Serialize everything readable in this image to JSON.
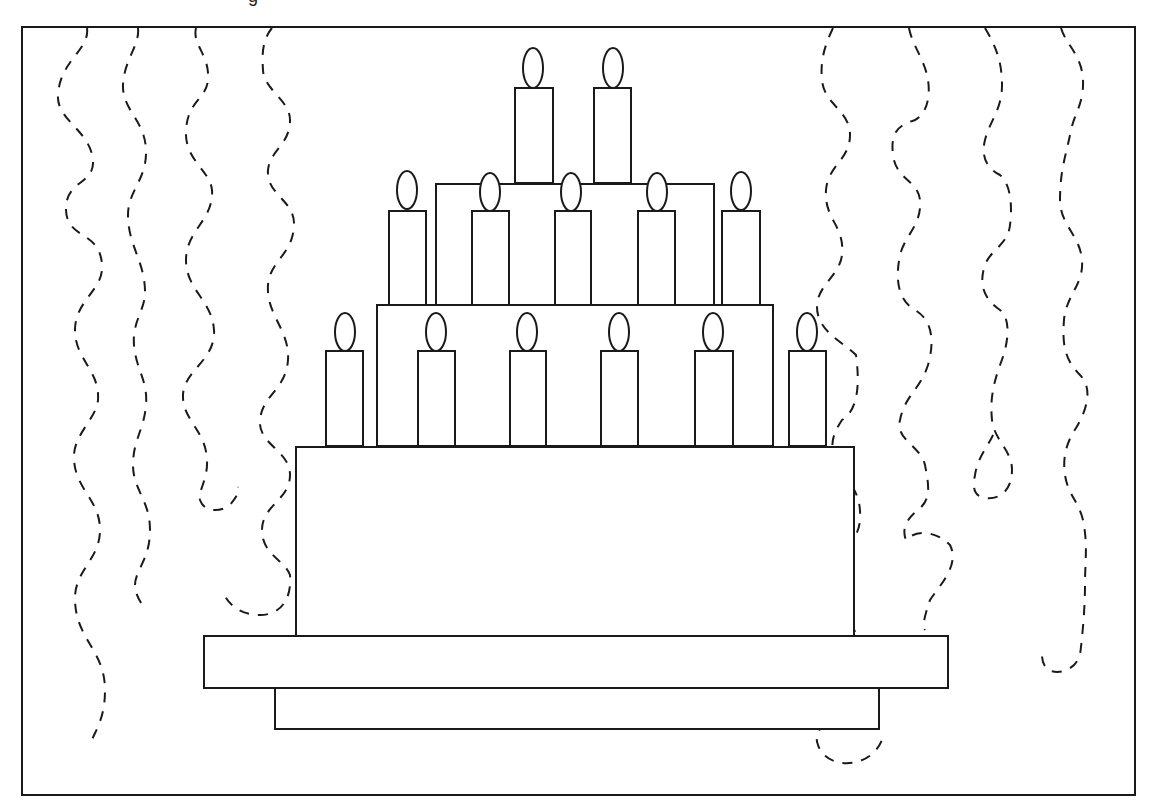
{
  "image": {
    "title_fragment": "g",
    "subject": "birthday cake with candles and streamers"
  },
  "colors": {
    "line": "#1a1a1a",
    "background": "#ffffff"
  },
  "frame": {
    "x": 22,
    "y": 27,
    "w": 1113,
    "h": 768
  },
  "cake": {
    "tiers": [
      {
        "name": "top-tier",
        "x": 436,
        "y": 184,
        "w": 278,
        "h": 121
      },
      {
        "name": "middle-tier",
        "x": 377,
        "y": 305,
        "w": 396,
        "h": 141
      },
      {
        "name": "bottom-tier",
        "x": 296,
        "y": 447,
        "w": 558,
        "h": 189
      }
    ],
    "plate": {
      "x": 204,
      "y": 636,
      "w": 744,
      "h": 52
    },
    "base": {
      "x": 275,
      "y": 688,
      "w": 604,
      "h": 41
    },
    "candles": [
      {
        "row": "top",
        "x": 515,
        "y": 88,
        "w": 38,
        "h": 95,
        "flame": {
          "cx": 533,
          "cy": 68,
          "rx": 10,
          "ry": 20
        }
      },
      {
        "row": "top",
        "x": 594,
        "y": 88,
        "w": 37,
        "h": 95,
        "flame": {
          "cx": 613,
          "cy": 68,
          "rx": 10,
          "ry": 20
        }
      },
      {
        "row": "middle",
        "x": 389,
        "y": 211,
        "w": 37,
        "h": 94,
        "flame": {
          "cx": 407,
          "cy": 190,
          "rx": 10,
          "ry": 19
        }
      },
      {
        "row": "middle",
        "x": 472,
        "y": 211,
        "w": 37,
        "h": 94,
        "flame": {
          "cx": 490,
          "cy": 192,
          "rx": 10,
          "ry": 19
        }
      },
      {
        "row": "middle",
        "x": 555,
        "y": 211,
        "w": 36,
        "h": 94,
        "flame": {
          "cx": 571,
          "cy": 192,
          "rx": 10,
          "ry": 19
        }
      },
      {
        "row": "middle",
        "x": 638,
        "y": 211,
        "w": 37,
        "h": 94,
        "flame": {
          "cx": 657,
          "cy": 192,
          "rx": 10,
          "ry": 19
        }
      },
      {
        "row": "middle",
        "x": 722,
        "y": 211,
        "w": 38,
        "h": 94,
        "flame": {
          "cx": 741,
          "cy": 191,
          "rx": 10,
          "ry": 19
        }
      },
      {
        "row": "bottom",
        "x": 326,
        "y": 351,
        "w": 37,
        "h": 95,
        "flame": {
          "cx": 345,
          "cy": 332,
          "rx": 10,
          "ry": 19
        }
      },
      {
        "row": "bottom",
        "x": 418,
        "y": 351,
        "w": 37,
        "h": 95,
        "flame": {
          "cx": 436,
          "cy": 332,
          "rx": 10,
          "ry": 19
        }
      },
      {
        "row": "bottom",
        "x": 510,
        "y": 351,
        "w": 36,
        "h": 95,
        "flame": {
          "cx": 527,
          "cy": 332,
          "rx": 10,
          "ry": 19
        }
      },
      {
        "row": "bottom",
        "x": 601,
        "y": 351,
        "w": 37,
        "h": 95,
        "flame": {
          "cx": 619,
          "cy": 332,
          "rx": 10,
          "ry": 19
        }
      },
      {
        "row": "bottom",
        "x": 695,
        "y": 351,
        "w": 38,
        "h": 95,
        "flame": {
          "cx": 713,
          "cy": 332,
          "rx": 10,
          "ry": 19
        }
      },
      {
        "row": "bottom",
        "x": 789,
        "y": 351,
        "w": 37,
        "h": 95,
        "flame": {
          "cx": 807,
          "cy": 332,
          "rx": 10,
          "ry": 19
        }
      }
    ]
  },
  "streamers": [
    {
      "side": "left",
      "d": "M87 28 C90 50 60 60 58 95 C56 120 90 130 93 160 C95 185 65 180 66 210 C67 240 100 230 102 265 C104 290 75 300 75 330 C75 360 100 370 98 400 C96 420 72 435 74 460 C76 490 100 500 100 530 C100 560 74 570 75 600 C76 640 105 650 105 690 C105 720 95 730 90 745"
    },
    {
      "side": "left",
      "d": "M138 28 C140 45 124 60 123 85 C122 110 145 120 146 150 C147 180 128 190 128 215 C128 245 144 260 145 290 C146 310 132 320 134 345 C136 370 148 380 146 405 C144 430 133 440 133 465 C133 490 150 500 150 530 C150 560 135 570 135 585 C135 595 142 605 145 608"
    },
    {
      "side": "left",
      "d": "M196 28 C192 45 210 55 208 80 C206 100 188 100 186 130 C184 160 210 170 212 190 C214 220 186 230 186 260 C186 290 212 300 214 330 C216 360 184 370 183 395 C182 420 206 430 207 460 C208 480 198 490 200 500 C205 515 225 510 230 505 C238 495 240 490 238 487"
    },
    {
      "side": "left",
      "d": "M272 28 C262 40 262 55 263 70 C264 90 290 100 290 120 C290 145 270 150 268 170 C266 195 295 200 294 225 C293 255 270 260 268 285 C266 315 290 330 288 360 C286 390 262 395 260 420 C258 445 290 450 290 475 C290 500 262 505 262 530 C262 555 285 560 290 575 C292 600 280 615 260 615 C240 615 228 605 222 590"
    },
    {
      "side": "right",
      "d": "M833 28 C825 45 820 60 822 80 C824 105 850 110 850 135 C850 160 828 165 826 190 C824 220 845 225 842 255 C840 275 818 285 817 305 C816 330 840 340 856 355 C860 385 858 410 842 420 C832 435 830 445 835 460 C842 480 862 485 860 520 C858 545 835 555 830 580 C826 605 852 615 858 640 C864 660 860 680 852 695 C842 715 810 725 818 745 C826 770 870 770 882 740"
    },
    {
      "side": "right",
      "d": "M909 28 C912 45 925 60 928 80 C931 100 925 115 915 120 C900 125 890 130 893 155 C896 180 918 180 920 200 C922 225 905 235 900 255 C895 280 898 300 915 310 C932 320 935 340 928 365 C920 390 905 395 900 420 C895 440 920 445 925 465 C930 490 930 500 918 510 C905 520 902 530 906 540 C915 530 935 530 950 545 C960 565 940 585 930 600 C925 615 922 625 925 630"
    },
    {
      "side": "right",
      "d": "M985 28 C995 45 1002 60 1002 85 C1002 110 990 120 985 140 C980 160 990 170 1000 175 C1012 185 1012 210 1010 225 C1008 245 990 250 985 265 C978 285 985 300 1000 310 C1012 320 1008 345 1000 365 C993 385 990 400 992 420 C994 440 1012 450 1012 470 C1012 490 1000 500 985 498 C975 496 972 490 975 475 C978 455 990 445 995 430"
    },
    {
      "side": "right",
      "d": "M1061 28 C1066 45 1082 55 1083 80 C1084 105 1073 115 1070 135 C1066 155 1060 170 1060 200 C1060 225 1080 235 1082 260 C1084 285 1066 295 1064 320 C1062 345 1065 360 1080 375 C1095 390 1084 415 1076 428 C1068 440 1062 455 1065 475 C1068 495 1078 500 1083 520 C1088 545 1085 560 1085 585 C1085 610 1082 640 1080 655 C1075 670 1060 675 1048 670 C1043 665 1042 660 1042 655"
    }
  ]
}
